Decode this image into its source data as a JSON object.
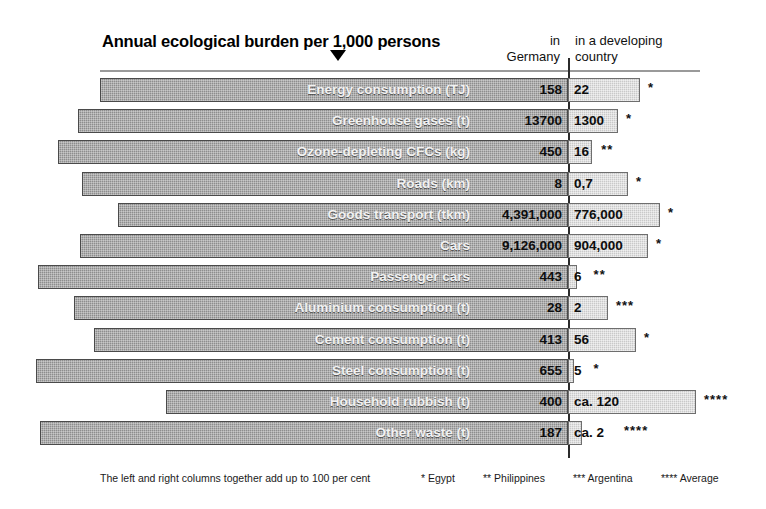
{
  "header": {
    "title": "Annual ecological burden per 1,000 persons",
    "col_left_line1": "in",
    "col_left_line2": "Germany",
    "col_right_line1": "in a developing",
    "col_right_line2": "country"
  },
  "footer": {
    "note": "The left and right columns together add up to 100 per cent",
    "keys": [
      {
        "marks": "*",
        "label": "Egypt"
      },
      {
        "marks": "**",
        "label": "Philippines"
      },
      {
        "marks": "***",
        "label": "Argentina"
      },
      {
        "marks": "****",
        "label": "Average"
      }
    ]
  },
  "colors": {
    "bar_left": "#8d8d8d",
    "bar_left_border": "#4a4a4a",
    "bar_right": "#c9c9c9",
    "bar_right_border": "#6e6e6e",
    "divider": "#2b2b2b",
    "background": "#ffffff",
    "label_text": "#f2f2f2",
    "value_text": "#0d0d0d"
  },
  "chart_data": {
    "type": "bar",
    "title": "Annual ecological burden per 1,000 persons",
    "subtitle": "",
    "xlabel": "",
    "ylabel": "",
    "orientation": "horizontal",
    "layout": "diverging-paired",
    "note": "Paired horizontal bars diverging from a central axis; left bar = Germany share, right bar = developing country share; each pair sums to 100 per cent.",
    "series": [
      {
        "name": "in Germany",
        "side": "left"
      },
      {
        "name": "in a developing country",
        "side": "right"
      }
    ],
    "categories": [
      "Energy consumption (TJ)",
      "Greenhouse gases (t)",
      "Ozone-depleting CFCs (kg)",
      "Roads (km)",
      "Goods transport (tkm)",
      "Cars",
      "Passenger cars",
      "Aluminium consumption (t)",
      "Cement consumption (t)",
      "Steel consumption (t)",
      "Household rubbish (t)",
      "Other waste (t)"
    ],
    "rows": [
      {
        "category": "Energy consumption (TJ)",
        "germany_value": "158",
        "developing_value": "22",
        "footnote": "*",
        "left_px": 100,
        "right_px": 640
      },
      {
        "category": "Greenhouse gases (t)",
        "germany_value": "13700",
        "developing_value": "1300",
        "footnote": "*",
        "left_px": 78,
        "right_px": 618
      },
      {
        "category": "Ozone-depleting CFCs (kg)",
        "germany_value": "450",
        "developing_value": "16",
        "footnote": "**",
        "left_px": 58,
        "right_px": 592
      },
      {
        "category": "Roads (km)",
        "germany_value": "8",
        "developing_value": "0,7",
        "footnote": "*",
        "left_px": 82,
        "right_px": 628
      },
      {
        "category": "Goods transport (tkm)",
        "germany_value": "4,391,000",
        "developing_value": "776,000",
        "footnote": "*",
        "left_px": 118,
        "right_px": 660
      },
      {
        "category": "Cars",
        "germany_value": "9,126,000",
        "developing_value": "904,000",
        "footnote": "*",
        "left_px": 80,
        "right_px": 648
      },
      {
        "category": "Passenger cars",
        "germany_value": "443",
        "developing_value": "6",
        "footnote": "**",
        "left_px": 38,
        "right_px": 577
      },
      {
        "category": "Aluminium consumption (t)",
        "germany_value": "28",
        "developing_value": "2",
        "footnote": "***",
        "left_px": 74,
        "right_px": 608
      },
      {
        "category": "Cement consumption (t)",
        "germany_value": "413",
        "developing_value": "56",
        "footnote": "*",
        "left_px": 94,
        "right_px": 636
      },
      {
        "category": "Steel consumption (t)",
        "germany_value": "655",
        "developing_value": "5",
        "footnote": "*",
        "left_px": 36,
        "right_px": 574
      },
      {
        "category": "Household rubbish (t)",
        "germany_value": "400",
        "developing_value": "ca. 120",
        "footnote": "****",
        "left_px": 166,
        "right_px": 696
      },
      {
        "category": "Other waste (t)",
        "germany_value": "187",
        "developing_value": "ca. 2",
        "footnote": "****",
        "left_px": 40,
        "right_px": 582
      }
    ]
  }
}
